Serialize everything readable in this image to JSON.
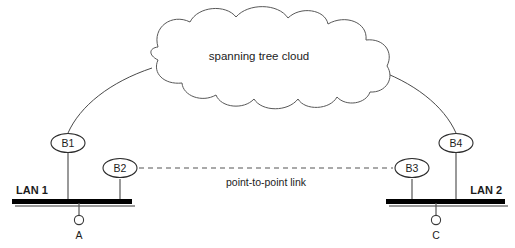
{
  "diagram": {
    "background_color": "#ffffff",
    "line_color": "#555555",
    "bar_color": "#000000",
    "cloud": {
      "label": "spanning tree cloud"
    },
    "links": {
      "point_to_point": {
        "label": "point-to-point link",
        "style": "dashed"
      }
    },
    "segments": [
      {
        "id": "lan1",
        "label": "LAN 1"
      },
      {
        "id": "lan2",
        "label": "LAN 2"
      }
    ],
    "bridges": [
      {
        "id": "b1",
        "label": "B1"
      },
      {
        "id": "b2",
        "label": "B2"
      },
      {
        "id": "b3",
        "label": "B3"
      },
      {
        "id": "b4",
        "label": "B4"
      }
    ],
    "hosts": [
      {
        "id": "host-a",
        "label": "A"
      },
      {
        "id": "host-c",
        "label": "C"
      }
    ]
  }
}
